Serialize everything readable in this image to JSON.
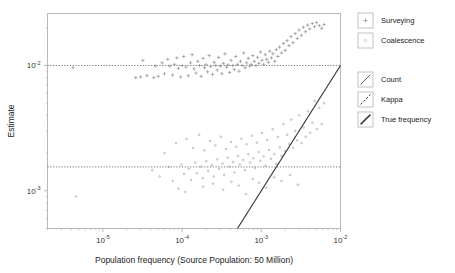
{
  "chart_data": {
    "type": "scatter",
    "title": "",
    "xlabel": "Population frequency (Source Population: 50 Million)",
    "ylabel": "Estimate",
    "xscale": "log",
    "yscale": "log",
    "xlim": [
      2e-06,
      0.01
    ],
    "ylim": [
      0.0005,
      0.026
    ],
    "xticks": [
      1e-05,
      0.0001,
      0.001,
      0.01
    ],
    "xtick_labels": [
      "10-5",
      "10-4",
      "10-3",
      "10-2"
    ],
    "xtick_mantissa": "10",
    "xtick_exponents": [
      "-5",
      "-4",
      "-3",
      "-2"
    ],
    "yticks": [
      0.01,
      0.001
    ],
    "ytick_labels": [
      "10-2",
      "10-3"
    ],
    "ytick_mantissa": "10",
    "ytick_exponents": [
      "-2",
      "-3"
    ],
    "grid": false,
    "legend_position": "right",
    "reference_lines": [
      {
        "name": "Count",
        "style": "dotted",
        "orientation": "horizontal",
        "y": 0.01,
        "color": "#777777"
      },
      {
        "name": "Kappa",
        "style": "dotted",
        "orientation": "horizontal",
        "y": 0.00155,
        "color": "#777777"
      },
      {
        "name": "True frequency",
        "style": "solid",
        "orientation": "diagonal",
        "slope": 1,
        "color": "#333333"
      }
    ],
    "series": [
      {
        "name": "Surveying",
        "marker": "plus",
        "color": "#8a8a8a",
        "points": [
          [
            4.2e-06,
            0.0096
          ],
          [
            2.6e-05,
            0.008
          ],
          [
            3e-05,
            0.0081
          ],
          [
            3.6e-05,
            0.0083
          ],
          [
            3.2e-05,
            0.011
          ],
          [
            4.4e-05,
            0.008
          ],
          [
            4.6e-05,
            0.0099
          ],
          [
            5e-05,
            0.0082
          ],
          [
            5.6e-05,
            0.0105
          ],
          [
            6e-05,
            0.0086
          ],
          [
            6.6e-05,
            0.0112
          ],
          [
            7e-05,
            0.0099
          ],
          [
            7.6e-05,
            0.0084
          ],
          [
            8e-05,
            0.0102
          ],
          [
            8.6e-05,
            0.0115
          ],
          [
            9e-05,
            0.0095
          ],
          [
            9.6e-05,
            0.0081
          ],
          [
            0.0001,
            0.01
          ],
          [
            0.000105,
            0.0118
          ],
          [
            0.000112,
            0.0097
          ],
          [
            0.00012,
            0.0083
          ],
          [
            0.000128,
            0.0105
          ],
          [
            0.000134,
            0.0122
          ],
          [
            0.000142,
            0.0094
          ],
          [
            0.00015,
            0.0087
          ],
          [
            0.000158,
            0.0108
          ],
          [
            0.000166,
            0.01
          ],
          [
            0.000174,
            0.0082
          ],
          [
            0.000184,
            0.0114
          ],
          [
            0.000192,
            0.0096
          ],
          [
            0.0002,
            0.0102
          ],
          [
            0.00021,
            0.0089
          ],
          [
            0.00022,
            0.012
          ],
          [
            0.00023,
            0.0098
          ],
          [
            0.000242,
            0.0085
          ],
          [
            0.000254,
            0.0106
          ],
          [
            0.000266,
            0.01
          ],
          [
            0.000278,
            0.0092
          ],
          [
            0.00029,
            0.0116
          ],
          [
            0.000304,
            0.0099
          ],
          [
            0.000318,
            0.0086
          ],
          [
            0.000332,
            0.0104
          ],
          [
            0.000348,
            0.0124
          ],
          [
            0.000364,
            0.0097
          ],
          [
            0.00038,
            0.0101
          ],
          [
            0.000398,
            0.0088
          ],
          [
            0.000416,
            0.011
          ],
          [
            0.000436,
            0.01
          ],
          [
            0.000456,
            0.0093
          ],
          [
            0.000476,
            0.0118
          ],
          [
            0.0005,
            0.0102
          ],
          [
            0.000522,
            0.009
          ],
          [
            0.000546,
            0.0108
          ],
          [
            0.000572,
            0.01
          ],
          [
            0.0006,
            0.0126
          ],
          [
            0.000626,
            0.0096
          ],
          [
            0.000654,
            0.0105
          ],
          [
            0.000684,
            0.0114
          ],
          [
            0.000716,
            0.0099
          ],
          [
            0.000748,
            0.0102
          ],
          [
            0.000782,
            0.012
          ],
          [
            0.000818,
            0.0108
          ],
          [
            0.000856,
            0.01
          ],
          [
            0.000896,
            0.0116
          ],
          [
            0.000936,
            0.0104
          ],
          [
            0.00098,
            0.0128
          ],
          [
            0.00102,
            0.011
          ],
          [
            0.00107,
            0.0102
          ],
          [
            0.00112,
            0.0122
          ],
          [
            0.00117,
            0.0112
          ],
          [
            0.00123,
            0.0106
          ],
          [
            0.00128,
            0.013
          ],
          [
            0.00134,
            0.0115
          ],
          [
            0.0014,
            0.0124
          ],
          [
            0.00148,
            0.0108
          ],
          [
            0.00155,
            0.0134
          ],
          [
            0.00162,
            0.0118
          ],
          [
            0.0017,
            0.014
          ],
          [
            0.0018,
            0.0126
          ],
          [
            0.0019,
            0.015
          ],
          [
            0.002,
            0.0132
          ],
          [
            0.00212,
            0.0158
          ],
          [
            0.00224,
            0.0144
          ],
          [
            0.00238,
            0.017
          ],
          [
            0.00252,
            0.0152
          ],
          [
            0.00268,
            0.018
          ],
          [
            0.00284,
            0.0164
          ],
          [
            0.003,
            0.0192
          ],
          [
            0.0032,
            0.0174
          ],
          [
            0.0034,
            0.0202
          ],
          [
            0.00362,
            0.0186
          ],
          [
            0.00386,
            0.021
          ],
          [
            0.0041,
            0.0196
          ],
          [
            0.0044,
            0.0216
          ],
          [
            0.0047,
            0.0204
          ],
          [
            0.005,
            0.022
          ],
          [
            0.0054,
            0.0208
          ],
          [
            0.0058,
            0.0198
          ],
          [
            0.0062,
            0.0212
          ]
        ]
      },
      {
        "name": "Coalescence",
        "marker": "dot",
        "color": "#9a9a9a",
        "points": [
          [
            4.6e-06,
            0.0009
          ],
          [
            4.2e-05,
            0.00146
          ],
          [
            5.2e-05,
            0.0013
          ],
          [
            6e-05,
            0.002
          ],
          [
            6.8e-05,
            0.00155
          ],
          [
            7.6e-05,
            0.0012
          ],
          [
            8.4e-05,
            0.0024
          ],
          [
            9e-05,
            0.00104
          ],
          [
            9.8e-05,
            0.00162
          ],
          [
            0.000106,
            0.00136
          ],
          [
            0.000114,
            0.0026
          ],
          [
            0.000122,
            0.0015
          ],
          [
            0.00013,
            0.00122
          ],
          [
            0.000138,
            0.0022
          ],
          [
            0.000146,
            0.00168
          ],
          [
            0.000154,
            0.00138
          ],
          [
            0.000164,
            0.0028
          ],
          [
            0.000172,
            0.00156
          ],
          [
            0.000182,
            0.00126
          ],
          [
            0.000192,
            0.0021
          ],
          [
            0.000202,
            0.00172
          ],
          [
            0.000214,
            0.00144
          ],
          [
            0.000226,
            0.0025
          ],
          [
            0.000238,
            0.0016
          ],
          [
            0.00025,
            0.0013
          ],
          [
            0.000264,
            0.0023
          ],
          [
            0.000278,
            0.00178
          ],
          [
            0.000292,
            0.0015
          ],
          [
            0.000308,
            0.0027
          ],
          [
            0.000324,
            0.00165
          ],
          [
            0.00034,
            0.00134
          ],
          [
            0.000358,
            0.00215
          ],
          [
            0.000376,
            0.00184
          ],
          [
            0.000396,
            0.00156
          ],
          [
            0.000416,
            0.00245
          ],
          [
            0.000438,
            0.0017
          ],
          [
            0.00046,
            0.0014
          ],
          [
            0.000484,
            0.00225
          ],
          [
            0.000508,
            0.0019
          ],
          [
            0.000534,
            0.00162
          ],
          [
            0.000562,
            0.0026
          ],
          [
            0.00059,
            0.00176
          ],
          [
            0.00062,
            0.00146
          ],
          [
            0.000652,
            0.00235
          ],
          [
            0.000686,
            0.00196
          ],
          [
            0.00072,
            0.00168
          ],
          [
            0.000758,
            0.00275
          ],
          [
            0.000796,
            0.00182
          ],
          [
            0.000836,
            0.00152
          ],
          [
            0.00088,
            0.00242
          ],
          [
            0.000924,
            0.00204
          ],
          [
            0.000972,
            0.00174
          ],
          [
            0.00102,
            0.0029
          ],
          [
            0.00107,
            0.00188
          ],
          [
            0.00113,
            0.00158
          ],
          [
            0.00119,
            0.00255
          ],
          [
            0.00125,
            0.00212
          ],
          [
            0.00132,
            0.0018
          ],
          [
            0.00139,
            0.0031
          ],
          [
            0.00146,
            0.00196
          ],
          [
            0.00154,
            0.00164
          ],
          [
            0.00162,
            0.00268
          ],
          [
            0.00171,
            0.00222
          ],
          [
            0.0018,
            0.0019
          ],
          [
            0.0019,
            0.0034
          ],
          [
            0.002,
            0.00208
          ],
          [
            0.00212,
            0.0028
          ],
          [
            0.00224,
            0.00236
          ],
          [
            0.00238,
            0.0037
          ],
          [
            0.00252,
            0.0022
          ],
          [
            0.00268,
            0.003
          ],
          [
            0.00284,
            0.00252
          ],
          [
            0.00302,
            0.004
          ],
          [
            0.00322,
            0.0024
          ],
          [
            0.00342,
            0.0032
          ],
          [
            0.00364,
            0.0027
          ],
          [
            0.00388,
            0.0043
          ],
          [
            0.00414,
            0.0029
          ],
          [
            0.00442,
            0.0035
          ],
          [
            0.00472,
            0.0052
          ],
          [
            0.00504,
            0.0031
          ],
          [
            0.0054,
            0.0046
          ],
          [
            0.0058,
            0.0034
          ],
          [
            0.0062,
            0.005
          ],
          [
            0.00011,
            0.00098
          ],
          [
            0.000185,
            0.00108
          ],
          [
            0.000245,
            0.00114
          ],
          [
            0.00033,
            0.00102
          ],
          [
            0.00042,
            0.00118
          ],
          [
            0.00052,
            0.0011
          ],
          [
            0.00064,
            0.00094
          ],
          [
            0.00078,
            0.00124
          ],
          [
            0.00094,
            0.00116
          ],
          [
            0.00115,
            0.00106
          ],
          [
            0.00145,
            0.00128
          ],
          [
            0.0018,
            0.0012
          ],
          [
            0.0023,
            0.00134
          ],
          [
            0.0029,
            0.00112
          ]
        ]
      }
    ],
    "legend_entries": [
      {
        "label": "Surveying",
        "kind": "marker",
        "marker": "plus"
      },
      {
        "label": "Coalescence",
        "kind": "marker",
        "marker": "dot"
      },
      {
        "label": "Count",
        "kind": "line",
        "style": "thin-solid"
      },
      {
        "label": "Kappa",
        "kind": "line",
        "style": "dashed"
      },
      {
        "label": "True frequency",
        "kind": "line",
        "style": "thick-solid"
      }
    ]
  },
  "colors": {
    "frame": "#b9b9b9",
    "dotted_line": "#8d8d8d",
    "true_line": "#3a3a3a",
    "marker": "#8e8e8e",
    "text": "#1a1a1a",
    "legend_box": "#c2c2c2",
    "background": "#ffffff"
  }
}
